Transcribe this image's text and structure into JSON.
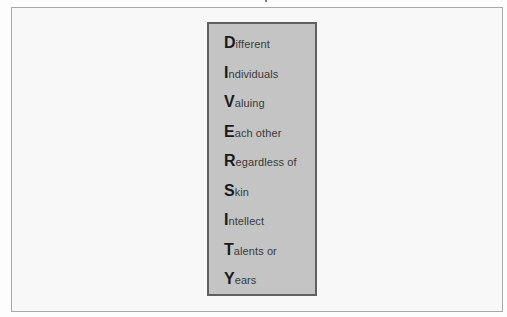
{
  "acrostic": {
    "word": "DIVERSITY",
    "lines": [
      {
        "initial": "D",
        "rest": "ifferent"
      },
      {
        "initial": "I",
        "rest": "ndividuals"
      },
      {
        "initial": "V",
        "rest": "aluing"
      },
      {
        "initial": "E",
        "rest": "ach other"
      },
      {
        "initial": "R",
        "rest": "egardless of"
      },
      {
        "initial": "S",
        "rest": "kin"
      },
      {
        "initial": "I",
        "rest": "ntellect"
      },
      {
        "initial": "T",
        "rest": "alents or"
      },
      {
        "initial": "Y",
        "rest": "ears"
      }
    ]
  },
  "colors": {
    "box_fill": "#c4c4c4",
    "box_border": "#606060",
    "frame_border": "#a8a8a8",
    "text": "#2e2e2e"
  }
}
